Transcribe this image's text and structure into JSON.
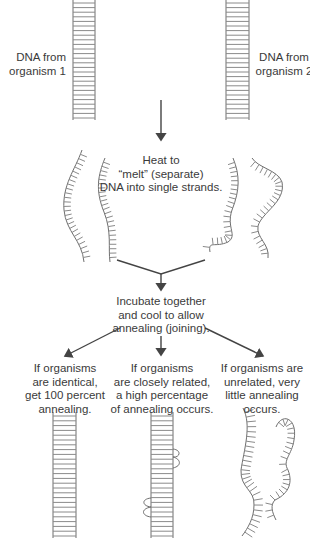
{
  "labels": {
    "dna1": [
      "DNA from",
      "organism 1"
    ],
    "dna2": [
      "DNA from",
      "organism 2"
    ],
    "heat": [
      "Heat to",
      "“melt” (separate)",
      "DNA into single strands."
    ],
    "incubate": [
      "Incubate together",
      "and cool to allow",
      "annealing (joining)."
    ],
    "identical": [
      "If organisms",
      "are identical,",
      "get 100 percent",
      "annealing."
    ],
    "related": [
      "If organisms",
      "are closely related,",
      "a high percentage",
      "of annealing occurs."
    ],
    "unrelated": [
      "If organisms are",
      "unrelated, very",
      "little annealing",
      "occurs."
    ]
  },
  "colors": {
    "strand": "#6e6e6e",
    "rung": "#8a8a8a",
    "arrow": "#444444",
    "text": "#3a3a3a"
  }
}
